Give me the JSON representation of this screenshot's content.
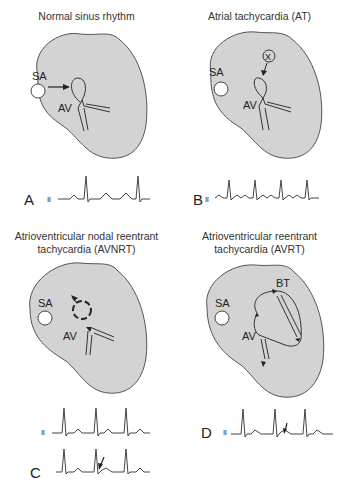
{
  "figure": {
    "heart_fill": "#d3d3d3",
    "outline": "#555555",
    "panels": [
      {
        "id": "A",
        "title_lines": [
          "Normal sinus rhythm"
        ],
        "letter": "A",
        "lead": "II",
        "labels": {
          "sa": "SA",
          "av": "AV"
        }
      },
      {
        "id": "B",
        "title_lines": [
          "Atrial tachycardia (AT)"
        ],
        "letter": "B",
        "lead": "II",
        "labels": {
          "sa": "SA",
          "av": "AV",
          "ectopic": "X"
        }
      },
      {
        "id": "C",
        "title_lines": [
          "Atrioventricular nodal reentrant",
          "tachycardia (AVNRT)"
        ],
        "letter": "C",
        "lead": "II",
        "labels": {
          "sa": "SA",
          "av": "AV"
        }
      },
      {
        "id": "D",
        "title_lines": [
          "Atrioventricular reentrant",
          "tachycardia (AVRT)"
        ],
        "letter": "D",
        "lead": "II",
        "labels": {
          "sa": "SA",
          "av": "AV",
          "bt": "BT"
        }
      }
    ]
  }
}
